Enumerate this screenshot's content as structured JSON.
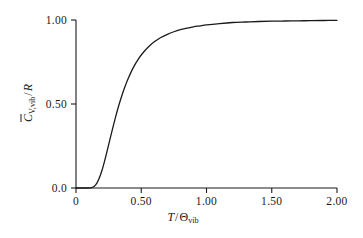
{
  "figure": {
    "background_color": "#ffffff",
    "line_color": "#1a1a1a"
  },
  "axes": {
    "x": {
      "title_parts": {
        "variable": "T",
        "separator": "/",
        "denominator": "Θ",
        "denominator_subscript": "vib"
      },
      "title_text": "T / Θvib",
      "tick_labels": [
        "0",
        "0.50",
        "1.00",
        "1.50",
        "2.00"
      ],
      "tick_values": [
        0,
        0.5,
        1.0,
        1.5,
        2.0
      ],
      "range": [
        0,
        2.0
      ]
    },
    "y": {
      "title_parts": {
        "symbol": "C",
        "symbol_subscript": "V,vib",
        "separator": "/",
        "denominator": "R"
      },
      "title_text": "C̅V,vib / R",
      "tick_labels": [
        "0.0",
        "0.50",
        "1.00"
      ],
      "tick_values": [
        0.0,
        0.5,
        1.0
      ],
      "range": [
        0,
        1.0
      ]
    }
  },
  "chart_data": {
    "type": "line",
    "title": "",
    "subtitle": "",
    "xlabel": "T / Θvib",
    "ylabel": "C̅V,vib / R",
    "xlim": [
      0,
      2.0
    ],
    "ylim": [
      0,
      1.0
    ],
    "xticks": [
      0,
      0.5,
      1.0,
      1.5,
      2.0
    ],
    "xticklabels": [
      "0",
      "0.50",
      "1.00",
      "1.50",
      "2.00"
    ],
    "yticks": [
      0.0,
      0.5,
      1.0
    ],
    "yticklabels": [
      "0.0",
      "0.50",
      "1.00"
    ],
    "grid": false,
    "legend": false,
    "series": [
      {
        "name": "Einstein vibrational heat capacity",
        "x": [
          0.0,
          0.02,
          0.04,
          0.06,
          0.08,
          0.1,
          0.12,
          0.14,
          0.16,
          0.18,
          0.2,
          0.22,
          0.24,
          0.26,
          0.28,
          0.3,
          0.32,
          0.34,
          0.36,
          0.38,
          0.4,
          0.44,
          0.48,
          0.52,
          0.56,
          0.6,
          0.65,
          0.7,
          0.75,
          0.8,
          0.85,
          0.9,
          0.95,
          1.0,
          1.1,
          1.2,
          1.3,
          1.4,
          1.5,
          1.6,
          1.7,
          1.8,
          1.9,
          2.0
        ],
        "y": [
          0.0,
          0.0,
          0.0,
          0.0,
          0.0,
          0.0,
          0.002,
          0.01,
          0.029,
          0.062,
          0.107,
          0.163,
          0.225,
          0.289,
          0.352,
          0.413,
          0.47,
          0.522,
          0.57,
          0.613,
          0.652,
          0.718,
          0.77,
          0.811,
          0.844,
          0.87,
          0.896,
          0.915,
          0.93,
          0.942,
          0.951,
          0.959,
          0.965,
          0.971,
          0.979,
          0.985,
          0.988,
          0.991,
          0.993,
          0.994,
          0.995,
          0.996,
          0.997,
          0.998
        ]
      }
    ]
  },
  "plot_geometry": {
    "left_px": 76,
    "right_px": 337,
    "top_px": 20,
    "bottom_px": 188
  }
}
